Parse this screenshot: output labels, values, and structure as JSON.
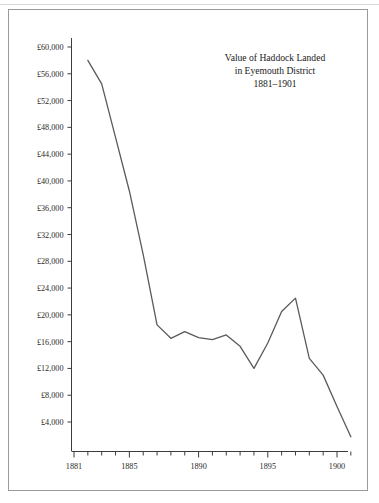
{
  "figure": {
    "title_lines": [
      "Value of Haddock Landed",
      "in Eyemouth District",
      "1881–1901"
    ],
    "frame_color": "#9a9a9a",
    "line_color": "#5a5a5a",
    "axis_color": "#3d3d3d",
    "background": "#ffffff"
  },
  "chart_data": {
    "type": "line",
    "title": "Value of Haddock Landed in Eyemouth District 1881–1901",
    "xlabel": "",
    "ylabel": "",
    "xlim": [
      1881,
      1901
    ],
    "ylim": [
      0,
      62000
    ],
    "grid": false,
    "legend": null,
    "y_tick_labels": [
      "£4,000",
      "£8,000",
      "£12,000",
      "£16,000",
      "£20,000",
      "£24,000",
      "£28,000",
      "£32,000",
      "£36,000",
      "£40,000",
      "£44,000",
      "£48,000",
      "£52,000",
      "£56,000",
      "£60,000"
    ],
    "y_tick_values": [
      4000,
      8000,
      12000,
      16000,
      20000,
      24000,
      28000,
      32000,
      36000,
      40000,
      44000,
      48000,
      52000,
      56000,
      60000
    ],
    "x_tick_labels": [
      "1881",
      "1885",
      "1890",
      "1895",
      "1900"
    ],
    "x_tick_values": [
      1881,
      1885,
      1890,
      1895,
      1900
    ],
    "x_minor_ticks": [
      1882,
      1883,
      1884,
      1886,
      1887,
      1888,
      1889,
      1891,
      1892,
      1893,
      1894,
      1896,
      1897,
      1898,
      1899,
      1901
    ],
    "x": [
      1882,
      1883,
      1884,
      1885,
      1886,
      1887,
      1888,
      1889,
      1890,
      1891,
      1892,
      1893,
      1894,
      1895,
      1896,
      1897,
      1898,
      1899,
      1900,
      1901
    ],
    "values": [
      58000,
      54500,
      46500,
      38500,
      29000,
      18500,
      16500,
      17500,
      16600,
      16300,
      17000,
      15300,
      12000,
      15800,
      20500,
      22500,
      13500,
      11000,
      6300,
      1800
    ],
    "series": [
      {
        "name": "Value of haddock landed",
        "values": [
          58000,
          54500,
          46500,
          38500,
          29000,
          18500,
          16500,
          17500,
          16600,
          16300,
          17000,
          15300,
          12000,
          15800,
          20500,
          22500,
          13500,
          11000,
          6300,
          1800
        ]
      }
    ]
  }
}
